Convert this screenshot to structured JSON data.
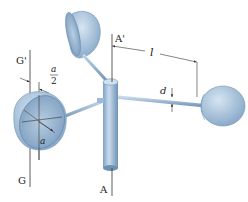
{
  "figure": {
    "labels": {
      "axis_top": "A'",
      "axis_bottom": "A",
      "cup_axis_top": "G'",
      "cup_axis_bottom": "G",
      "arm_length": "l",
      "arm_diameter": "d",
      "cup_radius": "a",
      "offset_numerator": "a",
      "offset_denominator": "2"
    },
    "colors": {
      "cup_fill": "#a9c3dc",
      "cup_dark": "#6f93b6",
      "cup_light": "#cfe0ef",
      "line": "#333333"
    }
  }
}
